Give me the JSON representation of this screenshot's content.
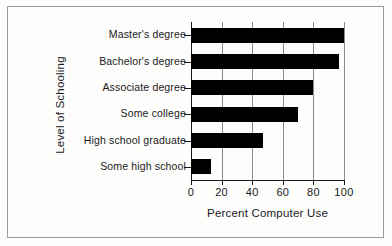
{
  "chart_data": {
    "type": "bar",
    "orientation": "horizontal",
    "title": "",
    "xlabel": "Percent Computer Use",
    "ylabel": "Level of Schooling",
    "categories": [
      "Master's degree",
      "Bachelor's degree",
      "Associate degree",
      "Some college",
      "High school graduate",
      "Some high school"
    ],
    "values": [
      100,
      97,
      80,
      70,
      47,
      13
    ],
    "xlim": [
      0,
      100
    ],
    "xticks": [
      0,
      20,
      40,
      60,
      80,
      100
    ],
    "xticklabels": [
      "0",
      "20",
      "40",
      "60",
      "80",
      "100"
    ],
    "grid": "vertical",
    "legend": "none",
    "bar_color": "#000000",
    "axis_color": "#1a1a1a",
    "grid_color": "#8c8c8c",
    "background_color": "#fdfdfc",
    "frame_color": "#9a9a9a"
  }
}
